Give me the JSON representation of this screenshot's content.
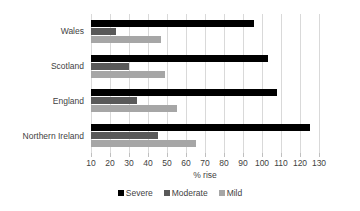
{
  "chart_data": {
    "type": "bar",
    "orientation": "horizontal",
    "title": "",
    "xlabel": "% rise",
    "ylabel": "",
    "categories": [
      "Wales",
      "Scotland",
      "England",
      "Northern Ireland"
    ],
    "series": [
      {
        "name": "Severe",
        "color": "#000000",
        "values": [
          96,
          103,
          108,
          125
        ]
      },
      {
        "name": "Moderate",
        "color": "#595959",
        "values": [
          23,
          30,
          34,
          45
        ]
      },
      {
        "name": "Mild",
        "color": "#a6a6a6",
        "values": [
          47,
          49,
          55,
          65
        ]
      }
    ],
    "xlim": [
      10,
      130
    ],
    "xticks": [
      10,
      20,
      30,
      40,
      50,
      60,
      70,
      80,
      90,
      100,
      110,
      120,
      130
    ],
    "xtick_labels": [
      "10",
      "20",
      "30",
      "40",
      "50",
      "60",
      "70",
      "80",
      "90",
      "100",
      "110",
      "120",
      "130"
    ],
    "grid": "vertical",
    "legend_position": "bottom"
  },
  "legend": {
    "items": [
      {
        "label": "Severe",
        "color": "#000000"
      },
      {
        "label": "Moderate",
        "color": "#595959"
      },
      {
        "label": "Mild",
        "color": "#a6a6a6"
      }
    ]
  },
  "axis": {
    "x_title": "% rise"
  }
}
